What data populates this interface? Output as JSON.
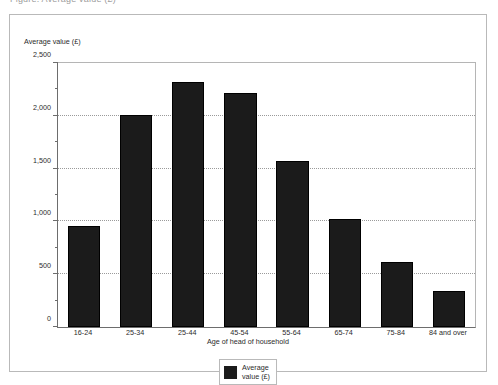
{
  "top_caption": "Figure: Average value (£)",
  "chart_data": {
    "type": "bar",
    "title": "",
    "xlabel": "Age of head of household",
    "ylabel": "Average value (£)",
    "categories": [
      "16-24",
      "25-34",
      "25-44",
      "45-54",
      "55-64",
      "65-74",
      "75-84",
      "84 and over"
    ],
    "values": [
      960,
      2010,
      2320,
      2220,
      1570,
      1025,
      615,
      340
    ],
    "series": [
      {
        "name": "Average value (£)",
        "values": [
          960,
          2010,
          2320,
          2220,
          1570,
          1025,
          615,
          340
        ]
      }
    ],
    "ylim": [
      0,
      2500
    ],
    "y_ticks": [
      0,
      500,
      1000,
      1500,
      2000,
      2500
    ],
    "y_tick_labels": [
      "0",
      "500",
      "1,000",
      "1,500",
      "2,000",
      "2,500"
    ],
    "y_minor_ticks": [
      250,
      750,
      1250,
      1750,
      2250
    ],
    "grid": true,
    "grid_axis": "y",
    "legend": {
      "position": "bottom",
      "entries": [
        {
          "label": "Average\nvalue (£)",
          "color": "#1b1b1b"
        }
      ]
    },
    "bar_color": "#1b1b1b"
  }
}
